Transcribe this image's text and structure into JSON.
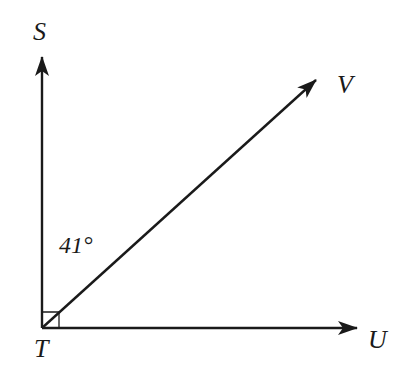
{
  "diagram": {
    "type": "angle-figure",
    "vertex": {
      "label": "T"
    },
    "rays": [
      {
        "label": "S",
        "direction": "up"
      },
      {
        "label": "V",
        "direction": "up-right"
      },
      {
        "label": "U",
        "direction": "right"
      }
    ],
    "right_angle_marker": {
      "at": "T",
      "between": [
        "S",
        "U"
      ]
    },
    "angle_annotation": {
      "text": "41°",
      "between": [
        "S",
        "V"
      ]
    },
    "colors": {
      "stroke": "#1a1a1a",
      "background": "#ffffff"
    }
  }
}
